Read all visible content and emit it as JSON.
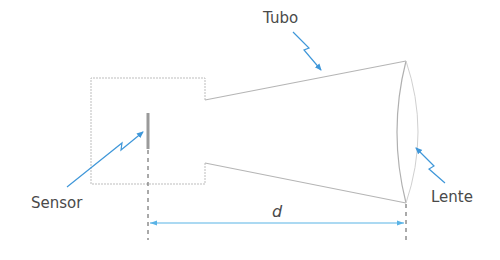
{
  "diagram": {
    "labels": {
      "tube": "Tubo",
      "sensor": "Sensor",
      "lens": "Lente",
      "distance": "d"
    },
    "colors": {
      "outline": "#b5b5b5",
      "sensor_bar": "#9a9a9a",
      "arrow": "#3f97d9",
      "dimension": "#59b3e6",
      "text": "#4a4a4a",
      "guide": "#555555"
    }
  }
}
